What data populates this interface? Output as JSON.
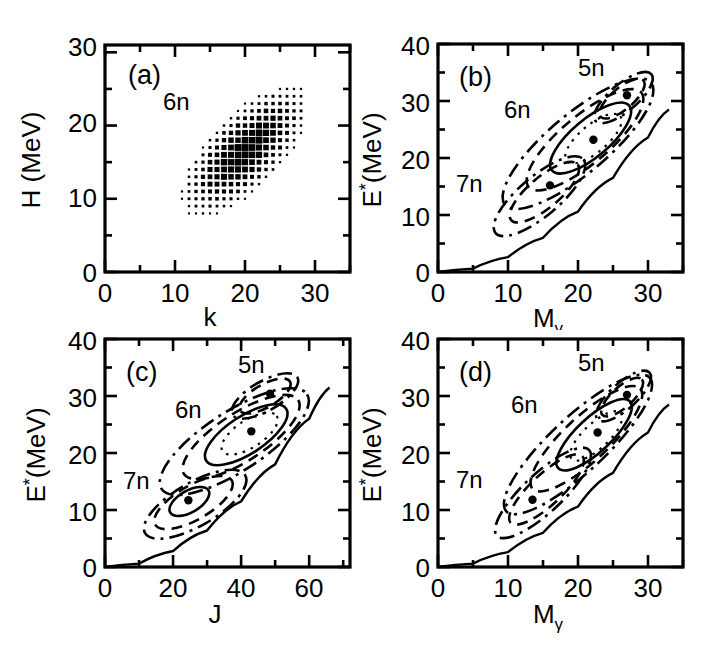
{
  "figure": {
    "title": "",
    "background_color": "#ffffff",
    "ink_color": "#000000",
    "panel_count": 4
  },
  "panels": {
    "a": {
      "label": "(a)",
      "xlabel": "k",
      "ylabel": "H (MeV)",
      "annotation": "6n",
      "xticks": [
        "0",
        "10",
        "20",
        "30"
      ],
      "yticks": [
        "0",
        "10",
        "20",
        "30"
      ]
    },
    "b": {
      "label": "(b)",
      "xlabel_main": "M",
      "xlabel_sub": "γ",
      "ylabel_main": "E",
      "ylabel_sup": "*",
      "ylabel_rest": "(MeV)",
      "annotations": [
        "5n",
        "6n",
        "7n"
      ],
      "xticks": [
        "0",
        "10",
        "20",
        "30"
      ],
      "yticks": [
        "0",
        "10",
        "20",
        "30",
        "40"
      ]
    },
    "c": {
      "label": "(c)",
      "xlabel": "J",
      "ylabel_main": "E",
      "ylabel_sup": "*",
      "ylabel_rest": "(MeV)",
      "annotations": [
        "5n",
        "6n",
        "7n"
      ],
      "xticks": [
        "0",
        "20",
        "40",
        "60"
      ],
      "yticks": [
        "0",
        "10",
        "20",
        "30",
        "40"
      ]
    },
    "d": {
      "label": "(d)",
      "xlabel_main": "M",
      "xlabel_sub": "γ",
      "ylabel_main": "E",
      "ylabel_sup": "*",
      "ylabel_rest": "(MeV)",
      "annotations": [
        "5n",
        "6n",
        "7n"
      ],
      "xticks": [
        "0",
        "10",
        "20",
        "30"
      ],
      "yticks": [
        "0",
        "10",
        "20",
        "30",
        "40"
      ]
    }
  },
  "chart_data": [
    {
      "panel": "a",
      "type": "heatmap",
      "title": "(a)",
      "xlabel": "k",
      "ylabel": "H (MeV)",
      "xlim": [
        0,
        35
      ],
      "ylim": [
        0,
        31
      ],
      "xticks": [
        0,
        10,
        20,
        30
      ],
      "yticks": [
        0,
        10,
        20,
        30
      ],
      "minor_tick_step": 5,
      "grid": false,
      "legend": "none",
      "annotations": [
        {
          "text": "6n",
          "x": 8.5,
          "y": 24.5
        }
      ],
      "marker_style": "variable-size-square (density box plot)",
      "distribution": {
        "description": "Correlated cloud of density boxes along the diagonal; box area encodes counts.",
        "cell_step_x": 1.0,
        "cell_step_y": 1.0,
        "centroid": [
          20.0,
          16.5
        ],
        "k_range": [
          8,
          28
        ],
        "H_range": [
          5,
          27
        ],
        "ridge_slope": 0.95,
        "ridge_intercept": -2.5,
        "sigma_major": 5.0,
        "sigma_minor": 2.1,
        "ridge_angle_deg": 44
      }
    },
    {
      "panel": "b",
      "type": "line",
      "title": "(b)",
      "xlabel": "Mγ",
      "ylabel": "E*(MeV)",
      "xlim": [
        0,
        35
      ],
      "ylim": [
        0,
        40
      ],
      "xticks": [
        0,
        10,
        20,
        30
      ],
      "yticks": [
        0,
        10,
        20,
        30,
        40
      ],
      "minor_tick_step_x": 5,
      "minor_tick_step_y": 5,
      "grid": false,
      "legend": "none",
      "annotations": [
        {
          "text": "5n",
          "x": 23.0,
          "y": 36.0
        },
        {
          "text": "6n",
          "x": 12.5,
          "y": 29.5
        },
        {
          "text": "7n",
          "x": 6.0,
          "y": 15.0
        }
      ],
      "yrast_line": {
        "style": "solid",
        "points": [
          [
            0,
            0
          ],
          [
            5,
            0.6
          ],
          [
            10,
            2.6
          ],
          [
            15,
            6.0
          ],
          [
            20,
            10.6
          ],
          [
            25,
            16.5
          ],
          [
            30,
            23.6
          ],
          [
            33,
            28.5
          ]
        ]
      },
      "groups": [
        {
          "name": "5n",
          "centroid": [
            27.0,
            31.0
          ],
          "centroid_marker": "filled-circle",
          "ellipses": [
            {
              "level": "outer",
              "style": "dash-dot",
              "cx": 26.5,
              "cy": 30.6,
              "rx": 5.2,
              "ry": 2.4,
              "angle_deg": -40
            },
            {
              "level": "mid",
              "style": "dashed",
              "cx": 26.3,
              "cy": 30.4,
              "rx": 4.0,
              "ry": 1.9,
              "angle_deg": -40
            }
          ]
        },
        {
          "name": "6n",
          "centroid": [
            22.2,
            23.2
          ],
          "centroid_marker": "filled-circle",
          "ellipses": [
            {
              "level": "outer",
              "style": "dash-dot",
              "cx": 20.0,
              "cy": 22.5,
              "rx": 13.6,
              "ry": 5.2,
              "angle_deg": -40
            },
            {
              "level": "mid",
              "style": "dashed",
              "cx": 21.0,
              "cy": 23.2,
              "rx": 10.5,
              "ry": 4.2,
              "angle_deg": -40
            },
            {
              "level": "inner",
              "style": "solid",
              "cx": 21.8,
              "cy": 23.5,
              "rx": 7.2,
              "ry": 3.3,
              "angle_deg": -40
            },
            {
              "level": "core",
              "style": "dotted",
              "cx": 22.2,
              "cy": 23.4,
              "rx": 5.0,
              "ry": 2.4,
              "angle_deg": -40
            }
          ]
        },
        {
          "name": "7n",
          "centroid": [
            16.0,
            15.2
          ],
          "centroid_marker": "filled-circle",
          "ellipses": [
            {
              "level": "outer",
              "style": "dash-dot",
              "cx": 14.5,
              "cy": 13.3,
              "rx": 8.2,
              "ry": 3.5,
              "angle_deg": -40
            },
            {
              "level": "mid",
              "style": "dashed",
              "cx": 15.2,
              "cy": 14.0,
              "rx": 6.2,
              "ry": 2.7,
              "angle_deg": -40
            }
          ]
        }
      ]
    },
    {
      "panel": "c",
      "type": "line",
      "title": "(c)",
      "xlabel": "J",
      "ylabel": "E*(MeV)",
      "xlim": [
        0,
        72
      ],
      "ylim": [
        0,
        40
      ],
      "xticks": [
        0,
        20,
        40,
        60
      ],
      "yticks": [
        0,
        10,
        20,
        30,
        40
      ],
      "minor_tick_step_x": 10,
      "minor_tick_step_y": 5,
      "grid": false,
      "legend": "none",
      "annotations": [
        {
          "text": "5n",
          "x": 40.0,
          "y": 36.0
        },
        {
          "text": "6n",
          "x": 24.0,
          "y": 27.5
        },
        {
          "text": "7n",
          "x": 10.0,
          "y": 15.0
        }
      ],
      "yrast_line": {
        "style": "solid",
        "points": [
          [
            0,
            0
          ],
          [
            10,
            0.6
          ],
          [
            20,
            2.8
          ],
          [
            30,
            6.4
          ],
          [
            40,
            11.5
          ],
          [
            50,
            18.0
          ],
          [
            60,
            26.0
          ],
          [
            66,
            31.5
          ]
        ]
      },
      "groups": [
        {
          "name": "5n",
          "centroid": [
            48.5,
            30.4
          ],
          "centroid_marker": "filled-circle",
          "ellipses": [
            {
              "level": "outer",
              "style": "dash-dot",
              "cx": 47.0,
              "cy": 30.0,
              "rx": 11.0,
              "ry": 2.6,
              "angle_deg": -30
            },
            {
              "level": "mid",
              "style": "dashed",
              "cx": 47.0,
              "cy": 30.0,
              "rx": 8.5,
              "ry": 2.0,
              "angle_deg": -30
            }
          ]
        },
        {
          "name": "6n",
          "centroid": [
            43.0,
            23.8
          ],
          "centroid_marker": "filled-circle",
          "ellipses": [
            {
              "level": "outer",
              "style": "dash-dot",
              "cx": 38.0,
              "cy": 22.0,
              "rx": 25.5,
              "ry": 5.2,
              "angle_deg": -33
            },
            {
              "level": "mid",
              "style": "dashed",
              "cx": 40.0,
              "cy": 22.8,
              "rx": 20.0,
              "ry": 4.2,
              "angle_deg": -33
            },
            {
              "level": "inner",
              "style": "solid",
              "cx": 41.5,
              "cy": 23.2,
              "rx": 14.0,
              "ry": 3.3,
              "angle_deg": -33
            },
            {
              "level": "core",
              "style": "dotted",
              "cx": 42.5,
              "cy": 23.4,
              "rx": 9.5,
              "ry": 2.4,
              "angle_deg": -33
            }
          ]
        },
        {
          "name": "7n",
          "centroid": [
            24.5,
            11.7
          ],
          "centroid_marker": "filled-circle",
          "ellipses": [
            {
              "level": "outer",
              "style": "dash-dot",
              "cx": 26.5,
              "cy": 11.0,
              "rx": 17.0,
              "ry": 3.8,
              "angle_deg": -30
            },
            {
              "level": "mid",
              "style": "dashed",
              "cx": 26.0,
              "cy": 11.3,
              "rx": 13.0,
              "ry": 3.0,
              "angle_deg": -30
            },
            {
              "level": "inner",
              "style": "solid",
              "cx": 24.8,
              "cy": 11.5,
              "rx": 6.5,
              "ry": 1.9,
              "angle_deg": -30
            }
          ]
        }
      ]
    },
    {
      "panel": "d",
      "type": "line",
      "title": "(d)",
      "xlabel": "Mγ",
      "ylabel": "E*(MeV)",
      "xlim": [
        0,
        35
      ],
      "ylim": [
        0,
        40
      ],
      "xticks": [
        0,
        10,
        20,
        30
      ],
      "yticks": [
        0,
        10,
        20,
        30,
        40
      ],
      "minor_tick_step_x": 5,
      "minor_tick_step_y": 5,
      "grid": false,
      "legend": "none",
      "annotations": [
        {
          "text": "5n",
          "x": 23.0,
          "y": 36.0
        },
        {
          "text": "6n",
          "x": 13.5,
          "y": 29.5
        },
        {
          "text": "7n",
          "x": 6.0,
          "y": 15.5
        }
      ],
      "yrast_line": {
        "style": "solid",
        "points": [
          [
            0,
            0
          ],
          [
            5,
            0.6
          ],
          [
            10,
            2.6
          ],
          [
            15,
            6.0
          ],
          [
            20,
            10.6
          ],
          [
            25,
            16.5
          ],
          [
            30,
            23.6
          ],
          [
            33,
            28.5
          ]
        ]
      },
      "groups": [
        {
          "name": "5n",
          "centroid": [
            27.0,
            30.2
          ],
          "centroid_marker": "filled-circle",
          "ellipses": [
            {
              "level": "outer",
              "style": "dash-dot",
              "cx": 26.5,
              "cy": 30.0,
              "rx": 5.0,
              "ry": 2.3,
              "angle_deg": -42
            },
            {
              "level": "mid",
              "style": "dashed",
              "cx": 26.3,
              "cy": 29.8,
              "rx": 3.8,
              "ry": 1.8,
              "angle_deg": -42
            }
          ]
        },
        {
          "name": "6n",
          "centroid": [
            22.8,
            23.6
          ],
          "centroid_marker": "filled-circle",
          "ellipses": [
            {
              "level": "outer",
              "style": "dash-dot",
              "cx": 20.0,
              "cy": 21.5,
              "rx": 14.0,
              "ry": 4.8,
              "angle_deg": -43
            },
            {
              "level": "mid",
              "style": "dashed",
              "cx": 21.2,
              "cy": 22.5,
              "rx": 10.5,
              "ry": 3.9,
              "angle_deg": -43
            },
            {
              "level": "inner",
              "style": "solid",
              "cx": 22.3,
              "cy": 23.2,
              "rx": 7.0,
              "ry": 3.0,
              "angle_deg": -43
            },
            {
              "level": "core",
              "style": "dotted",
              "cx": 22.6,
              "cy": 23.0,
              "rx": 4.8,
              "ry": 2.2,
              "angle_deg": -43
            }
          ]
        },
        {
          "name": "7n",
          "centroid": [
            13.5,
            11.8
          ],
          "centroid_marker": "filled-circle",
          "ellipses": [
            {
              "level": "outer",
              "style": "dash-dot",
              "cx": 15.0,
              "cy": 13.0,
              "rx": 9.0,
              "ry": 3.4,
              "angle_deg": -43
            },
            {
              "level": "mid",
              "style": "dashed",
              "cx": 15.5,
              "cy": 13.6,
              "rx": 7.0,
              "ry": 2.7,
              "angle_deg": -43
            }
          ]
        }
      ]
    }
  ]
}
